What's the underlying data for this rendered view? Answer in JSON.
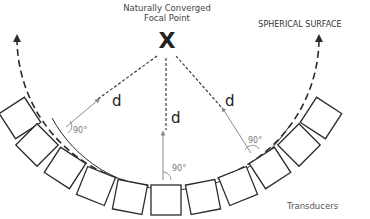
{
  "focal_point": {
    "label_line1": "Naturally Converged",
    "label_line2": "Focal Point",
    "marker": "X"
  },
  "surface_label": "SPHERICAL SURFACE",
  "transducers_label": "Transducers",
  "distance_labels": [
    "d",
    "d",
    "d"
  ],
  "angle_labels": [
    "90°",
    "90°",
    "90°"
  ],
  "transducer_count": 11,
  "colors": {
    "stroke_dark": "#2b2b2b",
    "stroke_gray": "#8a8a8a",
    "text": "#444444"
  }
}
